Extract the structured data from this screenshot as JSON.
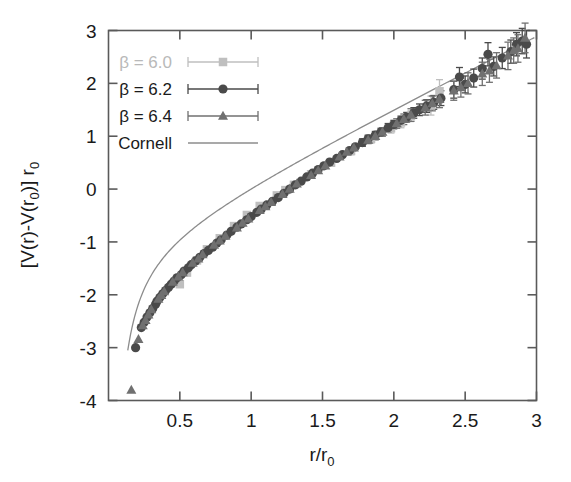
{
  "chart_data": {
    "type": "scatter",
    "title": "",
    "xlabel": "r/r0",
    "ylabel": "[V(r)-V(r0)] r0",
    "xlabel_parts": {
      "main": "r/r",
      "sub": "0"
    },
    "ylabel_parts": {
      "a": "[V(r)-V(r",
      "b": "0",
      "c": ")] r",
      "d": "0"
    },
    "xlim": [
      0.12,
      3.0
    ],
    "ylim": [
      -4,
      3
    ],
    "xticks": [
      0.5,
      1,
      1.5,
      2,
      2.5,
      3
    ],
    "xtick_labels": [
      "0.5",
      "1",
      "1.5",
      "2",
      "2.5",
      "3"
    ],
    "yticks": [
      3,
      2,
      1,
      0,
      -1,
      -2,
      -3,
      -4
    ],
    "ytick_labels": [
      "3",
      "2",
      "1",
      "0",
      "-1",
      "-2",
      "-3",
      "-4"
    ],
    "grid": false,
    "legend_position": "top-left",
    "series": [
      {
        "name": "beta = 6.0",
        "label_parts": {
          "beta": "β",
          "rest": " = 6.0"
        },
        "marker": "square",
        "color": "#bfbfbf",
        "points": [
          {
            "x": 0.62,
            "y": -1.35,
            "err": 0.05
          },
          {
            "x": 0.69,
            "y": -1.14,
            "err": 0.05
          },
          {
            "x": 0.78,
            "y": -0.93,
            "err": 0.05
          },
          {
            "x": 0.88,
            "y": -0.7,
            "err": 0.05
          },
          {
            "x": 0.97,
            "y": -0.49,
            "err": 0.05
          },
          {
            "x": 1.06,
            "y": -0.32,
            "err": 0.05
          },
          {
            "x": 1.18,
            "y": -0.12,
            "err": 0.05
          },
          {
            "x": 1.3,
            "y": 0.08,
            "err": 0.06
          },
          {
            "x": 1.42,
            "y": 0.28,
            "err": 0.06
          },
          {
            "x": 1.56,
            "y": 0.5,
            "err": 0.07
          },
          {
            "x": 1.7,
            "y": 0.72,
            "err": 0.07
          },
          {
            "x": 1.84,
            "y": 0.95,
            "err": 0.08
          },
          {
            "x": 1.98,
            "y": 1.15,
            "err": 0.09
          },
          {
            "x": 2.12,
            "y": 1.38,
            "err": 0.1
          },
          {
            "x": 2.26,
            "y": 1.58,
            "err": 0.18
          },
          {
            "x": 2.32,
            "y": 1.85,
            "err": 0.22
          },
          {
            "x": 0.55,
            "y": -1.58,
            "err": 0.05
          },
          {
            "x": 0.5,
            "y": -1.8,
            "err": 0.05
          },
          {
            "x": 1.24,
            "y": -0.02,
            "err": 0.05
          },
          {
            "x": 2.05,
            "y": 1.26,
            "err": 0.1
          }
        ]
      },
      {
        "name": "beta = 6.2",
        "label_parts": {
          "beta": "β",
          "rest": " = 6.2"
        },
        "marker": "circle",
        "color": "#4a4a4a",
        "points": [
          {
            "x": 0.19,
            "y": -3.0,
            "err": 0.05
          },
          {
            "x": 0.25,
            "y": -2.52,
            "err": 0.05
          },
          {
            "x": 0.29,
            "y": -2.34,
            "err": 0.05
          },
          {
            "x": 0.33,
            "y": -2.18,
            "err": 0.05
          },
          {
            "x": 0.36,
            "y": -2.05,
            "err": 0.05
          },
          {
            "x": 0.4,
            "y": -1.92,
            "err": 0.05
          },
          {
            "x": 0.44,
            "y": -1.8,
            "err": 0.05
          },
          {
            "x": 0.48,
            "y": -1.68,
            "err": 0.05
          },
          {
            "x": 0.53,
            "y": -1.55,
            "err": 0.05
          },
          {
            "x": 0.58,
            "y": -1.43,
            "err": 0.05
          },
          {
            "x": 0.64,
            "y": -1.29,
            "err": 0.05
          },
          {
            "x": 0.7,
            "y": -1.16,
            "err": 0.05
          },
          {
            "x": 0.76,
            "y": -1.02,
            "err": 0.05
          },
          {
            "x": 0.83,
            "y": -0.87,
            "err": 0.05
          },
          {
            "x": 0.9,
            "y": -0.72,
            "err": 0.05
          },
          {
            "x": 0.97,
            "y": -0.58,
            "err": 0.05
          },
          {
            "x": 1.04,
            "y": -0.44,
            "err": 0.05
          },
          {
            "x": 1.11,
            "y": -0.3,
            "err": 0.05
          },
          {
            "x": 1.19,
            "y": -0.16,
            "err": 0.05
          },
          {
            "x": 1.27,
            "y": 0.0,
            "err": 0.05
          },
          {
            "x": 1.35,
            "y": 0.15,
            "err": 0.05
          },
          {
            "x": 1.43,
            "y": 0.3,
            "err": 0.05
          },
          {
            "x": 1.51,
            "y": 0.44,
            "err": 0.06
          },
          {
            "x": 1.6,
            "y": 0.58,
            "err": 0.06
          },
          {
            "x": 1.69,
            "y": 0.73,
            "err": 0.06
          },
          {
            "x": 1.78,
            "y": 0.88,
            "err": 0.07
          },
          {
            "x": 1.87,
            "y": 1.02,
            "err": 0.07
          },
          {
            "x": 1.96,
            "y": 1.16,
            "err": 0.08
          },
          {
            "x": 2.05,
            "y": 1.3,
            "err": 0.08
          },
          {
            "x": 2.14,
            "y": 1.44,
            "err": 0.1
          },
          {
            "x": 2.23,
            "y": 1.57,
            "err": 0.12
          },
          {
            "x": 2.33,
            "y": 1.72,
            "err": 0.14
          },
          {
            "x": 2.42,
            "y": 1.88,
            "err": 0.16
          },
          {
            "x": 2.46,
            "y": 2.12,
            "err": 0.18
          },
          {
            "x": 2.56,
            "y": 2.1,
            "err": 0.17
          },
          {
            "x": 2.62,
            "y": 2.28,
            "err": 0.2
          },
          {
            "x": 2.7,
            "y": 2.32,
            "err": 0.18
          },
          {
            "x": 2.76,
            "y": 2.48,
            "err": 0.2
          },
          {
            "x": 2.82,
            "y": 2.6,
            "err": 0.22
          },
          {
            "x": 2.86,
            "y": 2.74,
            "err": 0.22
          },
          {
            "x": 2.9,
            "y": 2.8,
            "err": 0.24
          },
          {
            "x": 2.93,
            "y": 2.74,
            "err": 0.26
          },
          {
            "x": 2.66,
            "y": 2.55,
            "err": 0.22
          },
          {
            "x": 2.5,
            "y": 1.98,
            "err": 0.16
          },
          {
            "x": 2.28,
            "y": 1.64,
            "err": 0.13
          },
          {
            "x": 2.18,
            "y": 1.5,
            "err": 0.11
          },
          {
            "x": 2.09,
            "y": 1.36,
            "err": 0.09
          },
          {
            "x": 2.0,
            "y": 1.22,
            "err": 0.08
          },
          {
            "x": 1.91,
            "y": 1.08,
            "err": 0.07
          },
          {
            "x": 1.82,
            "y": 0.95,
            "err": 0.07
          },
          {
            "x": 1.73,
            "y": 0.8,
            "err": 0.06
          },
          {
            "x": 1.64,
            "y": 0.65,
            "err": 0.06
          },
          {
            "x": 1.55,
            "y": 0.51,
            "err": 0.06
          },
          {
            "x": 1.47,
            "y": 0.37,
            "err": 0.05
          },
          {
            "x": 1.39,
            "y": 0.23,
            "err": 0.05
          },
          {
            "x": 1.31,
            "y": 0.08,
            "err": 0.05
          },
          {
            "x": 1.23,
            "y": -0.08,
            "err": 0.05
          },
          {
            "x": 1.15,
            "y": -0.23,
            "err": 0.05
          },
          {
            "x": 1.07,
            "y": -0.38,
            "err": 0.05
          },
          {
            "x": 1.0,
            "y": -0.52,
            "err": 0.05
          },
          {
            "x": 0.93,
            "y": -0.66,
            "err": 0.05
          },
          {
            "x": 0.86,
            "y": -0.8,
            "err": 0.05
          },
          {
            "x": 0.79,
            "y": -0.96,
            "err": 0.05
          },
          {
            "x": 0.73,
            "y": -1.1,
            "err": 0.05
          },
          {
            "x": 0.67,
            "y": -1.22,
            "err": 0.05
          },
          {
            "x": 0.61,
            "y": -1.36,
            "err": 0.05
          },
          {
            "x": 0.56,
            "y": -1.49,
            "err": 0.05
          },
          {
            "x": 0.51,
            "y": -1.62,
            "err": 0.05
          },
          {
            "x": 0.46,
            "y": -1.74,
            "err": 0.05
          },
          {
            "x": 0.42,
            "y": -1.86,
            "err": 0.05
          },
          {
            "x": 0.38,
            "y": -1.98,
            "err": 0.05
          },
          {
            "x": 0.34,
            "y": -2.12,
            "err": 0.05
          },
          {
            "x": 0.31,
            "y": -2.26,
            "err": 0.05
          },
          {
            "x": 0.27,
            "y": -2.42,
            "err": 0.05
          },
          {
            "x": 0.23,
            "y": -2.62,
            "err": 0.05
          }
        ]
      },
      {
        "name": "beta = 6.4",
        "label_parts": {
          "beta": "β",
          "rest": " = 6.4"
        },
        "marker": "triangle",
        "color": "#707070",
        "points": [
          {
            "x": 0.16,
            "y": -3.8,
            "err": 0.05
          },
          {
            "x": 0.21,
            "y": -2.84,
            "err": 0.05
          },
          {
            "x": 0.26,
            "y": -2.48,
            "err": 0.05
          },
          {
            "x": 0.3,
            "y": -2.28,
            "err": 0.05
          },
          {
            "x": 0.35,
            "y": -2.08,
            "err": 0.05
          },
          {
            "x": 0.39,
            "y": -1.94,
            "err": 0.05
          },
          {
            "x": 0.45,
            "y": -1.76,
            "err": 0.05
          },
          {
            "x": 0.52,
            "y": -1.58,
            "err": 0.05
          },
          {
            "x": 0.59,
            "y": -1.4,
            "err": 0.05
          },
          {
            "x": 0.66,
            "y": -1.24,
            "err": 0.05
          },
          {
            "x": 0.74,
            "y": -1.06,
            "err": 0.05
          },
          {
            "x": 0.82,
            "y": -0.89,
            "err": 0.05
          },
          {
            "x": 0.9,
            "y": -0.73,
            "err": 0.05
          },
          {
            "x": 0.98,
            "y": -0.56,
            "err": 0.05
          },
          {
            "x": 1.06,
            "y": -0.4,
            "err": 0.05
          },
          {
            "x": 1.14,
            "y": -0.25,
            "err": 0.05
          },
          {
            "x": 1.22,
            "y": -0.1,
            "err": 0.05
          },
          {
            "x": 1.32,
            "y": 0.1,
            "err": 0.05
          },
          {
            "x": 1.42,
            "y": 0.26,
            "err": 0.05
          },
          {
            "x": 1.52,
            "y": 0.44,
            "err": 0.06
          },
          {
            "x": 1.62,
            "y": 0.61,
            "err": 0.06
          },
          {
            "x": 1.72,
            "y": 0.78,
            "err": 0.06
          },
          {
            "x": 1.82,
            "y": 0.93,
            "err": 0.07
          },
          {
            "x": 1.92,
            "y": 1.08,
            "err": 0.08
          },
          {
            "x": 2.02,
            "y": 1.24,
            "err": 0.09
          },
          {
            "x": 2.12,
            "y": 1.4,
            "err": 0.12
          },
          {
            "x": 2.22,
            "y": 1.54,
            "err": 0.14
          },
          {
            "x": 2.32,
            "y": 1.7,
            "err": 0.16
          },
          {
            "x": 2.42,
            "y": 1.86,
            "err": 0.18
          },
          {
            "x": 2.52,
            "y": 2.0,
            "err": 0.2
          },
          {
            "x": 2.62,
            "y": 2.18,
            "err": 0.22
          },
          {
            "x": 2.72,
            "y": 2.34,
            "err": 0.24
          },
          {
            "x": 2.8,
            "y": 2.52,
            "err": 0.26
          },
          {
            "x": 2.87,
            "y": 2.66,
            "err": 0.26
          },
          {
            "x": 2.92,
            "y": 2.86,
            "err": 0.28
          },
          {
            "x": 2.84,
            "y": 2.62,
            "err": 0.24
          },
          {
            "x": 2.67,
            "y": 2.24,
            "err": 0.22
          },
          {
            "x": 2.47,
            "y": 1.92,
            "err": 0.18
          },
          {
            "x": 2.27,
            "y": 1.62,
            "err": 0.14
          },
          {
            "x": 2.07,
            "y": 1.32,
            "err": 0.1
          },
          {
            "x": 1.87,
            "y": 1.0,
            "err": 0.07
          },
          {
            "x": 1.67,
            "y": 0.7,
            "err": 0.06
          },
          {
            "x": 1.47,
            "y": 0.35,
            "err": 0.05
          },
          {
            "x": 1.27,
            "y": 0.0,
            "err": 0.05
          },
          {
            "x": 1.1,
            "y": -0.33,
            "err": 0.05
          },
          {
            "x": 0.94,
            "y": -0.64,
            "err": 0.05
          },
          {
            "x": 0.78,
            "y": -0.98,
            "err": 0.05
          },
          {
            "x": 0.63,
            "y": -1.32,
            "err": 0.05
          },
          {
            "x": 0.49,
            "y": -1.66,
            "err": 0.05
          },
          {
            "x": 0.37,
            "y": -2.01,
            "err": 0.05
          },
          {
            "x": 0.28,
            "y": -2.38,
            "err": 0.05
          },
          {
            "x": 0.24,
            "y": -2.58,
            "err": 0.05
          }
        ]
      }
    ],
    "fit_curve": {
      "name": "Cornell",
      "label": "Cornell",
      "color": "#8c8c8c",
      "description": "Cornell potential fit V(r) = -e/r + sigma*r + const",
      "params": {
        "e": 0.295,
        "sigma": 1.345,
        "const": -1.05
      }
    }
  },
  "legend": {
    "entries": [
      {
        "label": "β = 6.0",
        "marker": "square",
        "color": "#bfbfbf",
        "faint": true,
        "has_errorbar": true
      },
      {
        "label": "β = 6.2",
        "marker": "circle",
        "color": "#4a4a4a",
        "faint": false,
        "has_errorbar": true
      },
      {
        "label": "β = 6.4",
        "marker": "triangle",
        "color": "#707070",
        "faint": false,
        "has_errorbar": true
      },
      {
        "label": "Cornell",
        "marker": "line",
        "color": "#8c8c8c",
        "faint": false,
        "has_errorbar": false
      }
    ]
  },
  "colors": {
    "background": "#ffffff",
    "frame": "#5a5a5a",
    "text": "#1a1a1a",
    "beta60": "#bfbfbf",
    "beta62": "#4a4a4a",
    "beta64": "#707070",
    "cornell": "#8c8c8c"
  }
}
